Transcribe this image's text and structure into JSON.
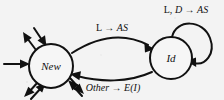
{
  "figure": {
    "kind": "state-transition-diagram",
    "background_color": "#f3f3f3",
    "ink_color": "#111111"
  },
  "states": [
    {
      "id": "new",
      "label": "New",
      "cx": 51,
      "cy": 66,
      "r": 22
    },
    {
      "id": "id",
      "label": "Id",
      "cx": 171,
      "cy": 58,
      "r": 21
    }
  ],
  "transitions": [
    {
      "id": "new-to-id",
      "from": "New",
      "to": "Id",
      "label_parts": [
        {
          "text": "L",
          "style": "upright"
        },
        {
          "text": " → ",
          "style": "upright"
        },
        {
          "text": "AS",
          "style": "italic"
        }
      ],
      "label_text": "L → AS",
      "label_x": 112,
      "label_y": 31
    },
    {
      "id": "id-to-new",
      "from": "Id",
      "to": "New",
      "label_parts": [
        {
          "text": "Other",
          "style": "italic"
        },
        {
          "text": " → ",
          "style": "upright"
        },
        {
          "text": "E(I)",
          "style": "italic"
        }
      ],
      "label_text": "Other → E(I)",
      "label_x": 113,
      "label_y": 91
    },
    {
      "id": "id-self-loop",
      "from": "Id",
      "to": "Id",
      "label_parts": [
        {
          "text": "L, ",
          "style": "upright"
        },
        {
          "text": "D",
          "style": "italic"
        },
        {
          "text": " → ",
          "style": "upright"
        },
        {
          "text": "AS",
          "style": "italic"
        }
      ],
      "label_text": "L, D → AS",
      "label_x": 186,
      "label_y": 12
    }
  ],
  "free_arrows": [
    {
      "id": "in-left",
      "direction": "incoming",
      "angle": "west"
    },
    {
      "id": "out-upper-left",
      "direction": "outgoing",
      "angle": "northwest"
    },
    {
      "id": "in-upper-left",
      "direction": "incoming",
      "angle": "northwest"
    },
    {
      "id": "out-lower-left",
      "direction": "outgoing",
      "angle": "southwest"
    },
    {
      "id": "in-lower-left",
      "direction": "incoming",
      "angle": "southwest"
    },
    {
      "id": "in-lower-right",
      "direction": "incoming",
      "angle": "southeast"
    },
    {
      "id": "out-lower-right",
      "direction": "outgoing",
      "angle": "southeast"
    }
  ]
}
